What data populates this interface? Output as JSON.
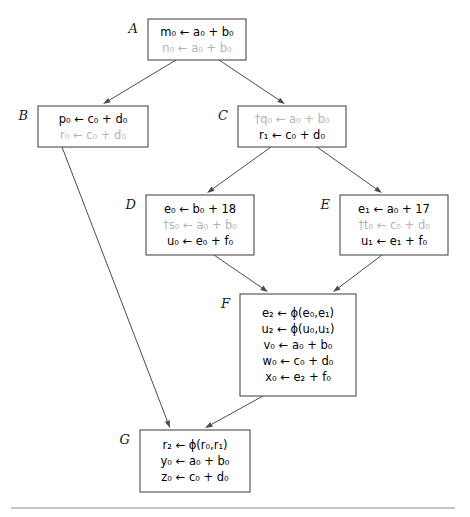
{
  "diagram": {
    "colors": {
      "box_stroke": "#4c4c4c",
      "text": "#000000",
      "dim_text": "#b4b4b4",
      "edge": "#4c4c4c",
      "rule": "#8c8c8c",
      "background": "#ffffff"
    },
    "nodes": [
      {
        "id": "A",
        "label": "A",
        "x": 148,
        "y": 19,
        "width": 98,
        "height": 41,
        "label_x": 138,
        "label_y": 33,
        "statements": [
          {
            "text": "m₀ ← a₀ + b₀",
            "dim": false
          },
          {
            "text": "n₀ ← a₀ + b₀",
            "dim": true
          }
        ]
      },
      {
        "id": "B",
        "label": "B",
        "x": 38,
        "y": 106,
        "width": 110,
        "height": 41,
        "label_x": 28,
        "label_y": 120,
        "statements": [
          {
            "text": "p₀ ← c₀ + d₀",
            "dim": false
          },
          {
            "text": "r₀ ← c₀ + d₀",
            "dim": true
          }
        ]
      },
      {
        "id": "C",
        "label": "C",
        "x": 238,
        "y": 106,
        "width": 108,
        "height": 41,
        "label_x": 228,
        "label_y": 120,
        "statements": [
          {
            "text": "†q₀ ← a₀ + b₀",
            "dim": true
          },
          {
            "text": "r₁ ← c₀ + d₀",
            "dim": false
          }
        ]
      },
      {
        "id": "D",
        "label": "D",
        "x": 146,
        "y": 195,
        "width": 108,
        "height": 60,
        "label_x": 136,
        "label_y": 209,
        "statements": [
          {
            "text": "e₀ ← b₀ + 18",
            "dim": false
          },
          {
            "text": "†s₀ ← a₀ + b₀",
            "dim": true
          },
          {
            "text": "u₀ ← e₀ + f₀",
            "dim": false
          }
        ]
      },
      {
        "id": "E",
        "label": "E",
        "x": 340,
        "y": 195,
        "width": 108,
        "height": 60,
        "label_x": 330,
        "label_y": 209,
        "statements": [
          {
            "text": "e₁ ← a₀ + 17",
            "dim": false
          },
          {
            "text": "†t₀ ← c₀ + d₀",
            "dim": true
          },
          {
            "text": "u₁ ← e₁ + f₀",
            "dim": false
          }
        ]
      },
      {
        "id": "F",
        "label": "F",
        "x": 240,
        "y": 294,
        "width": 116,
        "height": 102,
        "label_x": 230,
        "label_y": 308,
        "statements": [
          {
            "text": "e₂ ← ϕ(e₀,e₁)",
            "dim": false
          },
          {
            "text": "u₂ ← ϕ(u₀,u₁)",
            "dim": false
          },
          {
            "text": "v₀ ← a₀ + b₀",
            "dim": false
          },
          {
            "text": "w₀ ← c₀ + d₀",
            "dim": false
          },
          {
            "text": "x₀ ← e₂ + f₀",
            "dim": false
          }
        ]
      },
      {
        "id": "G",
        "label": "G",
        "x": 140,
        "y": 430,
        "width": 110,
        "height": 62,
        "label_x": 130,
        "label_y": 444,
        "statements": [
          {
            "text": "r₂ ← ϕ(r₀,r₁)",
            "dim": false
          },
          {
            "text": "y₀ ← a₀ + b₀",
            "dim": false
          },
          {
            "text": "z₀ ← c₀ + d₀",
            "dim": false
          }
        ]
      }
    ],
    "edges": [
      {
        "from": "A",
        "to": "B",
        "x1": 176,
        "y1": 60,
        "x2": 103,
        "y2": 104
      },
      {
        "from": "A",
        "to": "C",
        "x1": 219,
        "y1": 60,
        "x2": 285,
        "y2": 104
      },
      {
        "from": "C",
        "to": "D",
        "x1": 271,
        "y1": 147,
        "x2": 207,
        "y2": 193
      },
      {
        "from": "C",
        "to": "E",
        "x1": 317,
        "y1": 147,
        "x2": 382,
        "y2": 193
      },
      {
        "from": "D",
        "to": "F",
        "x1": 214,
        "y1": 255,
        "x2": 268,
        "y2": 292
      },
      {
        "from": "E",
        "to": "F",
        "x1": 382,
        "y1": 255,
        "x2": 333,
        "y2": 292
      },
      {
        "from": "B",
        "to": "G",
        "x1": 62,
        "y1": 147,
        "x2": 170,
        "y2": 428
      },
      {
        "from": "F",
        "to": "G",
        "x1": 263,
        "y1": 396,
        "x2": 205,
        "y2": 428
      }
    ],
    "footer_rule": {
      "x1": 11,
      "x2": 455,
      "y": 508
    }
  }
}
